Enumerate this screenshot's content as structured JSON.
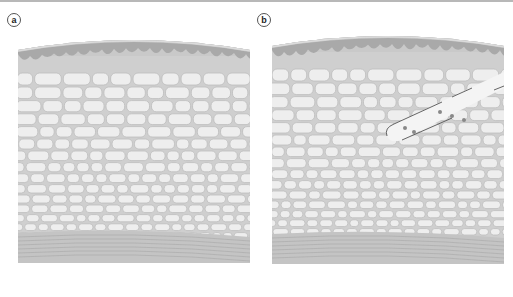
{
  "figure": {
    "panels": [
      {
        "id": "a",
        "label": "a",
        "description": "Cross-section of tissue layers: epidermis with wavy boundary, cellular layer of packed cells, striated base layer"
      },
      {
        "id": "b",
        "label": "b",
        "description": "Same tissue cross-section with an inserted needle/cannula track carrying small particles"
      }
    ],
    "colors": {
      "background": "#ffffff",
      "top_rule": "#b8b8b8",
      "outer_layer": "#c9c9c9",
      "outer_edge": "#dcdcdc",
      "wavy_layer": "#a9a9a9",
      "dermis_fill": "#cfcfcf",
      "cell_fill": "#eeeeee",
      "cell_stroke": "#bdbdbd",
      "base_layer": "#c4c4c4",
      "base_stripe": "#a8a8a8",
      "needle_fill": "#f4f4f4",
      "needle_stroke": "#555555",
      "particle": "#888888"
    }
  }
}
